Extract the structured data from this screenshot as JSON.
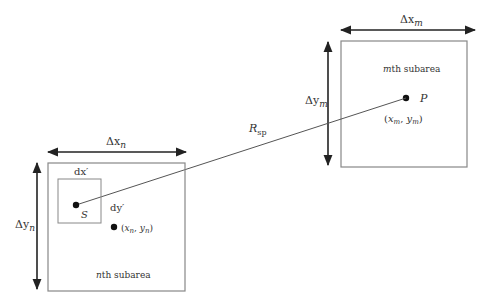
{
  "diagram": {
    "type": "subarea-geometry",
    "colors": {
      "line": "#555555",
      "box": "#888888",
      "text": "#333333",
      "dot": "#111111"
    },
    "m_subarea": {
      "label": "mth subarea",
      "label_italic": "m",
      "label_rest": "th subarea",
      "width_label": {
        "sym": "Δx",
        "sub": "m"
      },
      "height_label": {
        "sym": "Δy",
        "sub": "m"
      },
      "point": {
        "name": "P",
        "coord_label": "(xm, ym)",
        "x": "x",
        "xsub": "m",
        "y": "y",
        "ysub": "m"
      }
    },
    "n_subarea": {
      "label": "nth subarea",
      "label_italic": "n",
      "label_rest": "th subarea",
      "width_label": {
        "sym": "Δx",
        "sub": "n"
      },
      "height_label": {
        "sym": "Δy",
        "sub": "n"
      },
      "center_point": {
        "coord_label": "(xn, yn)",
        "x": "x",
        "xsub": "n",
        "y": "y",
        "ysub": "n"
      },
      "element": {
        "dx_label": "dx′",
        "dy_label": "dy′",
        "source_name": "S"
      }
    },
    "distance": {
      "sym": "R",
      "sub": "sp"
    }
  }
}
